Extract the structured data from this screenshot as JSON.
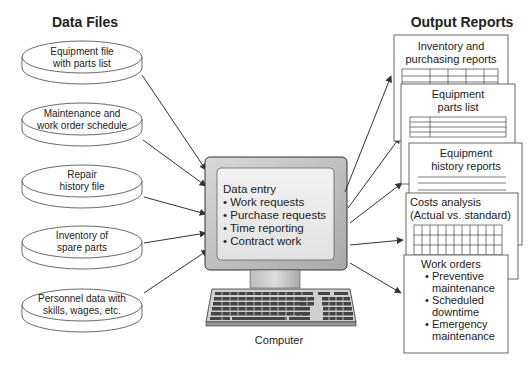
{
  "diagram": {
    "left_title": "Data Files",
    "right_title": "Output Reports",
    "data_files": [
      {
        "line1": "Equipment file",
        "line2": "with parts list"
      },
      {
        "line1": "Maintenance and",
        "line2": "work order schedule"
      },
      {
        "line1": "Repair",
        "line2": "history file"
      },
      {
        "line1": "Inventory of",
        "line2": "spare parts"
      },
      {
        "line1": "Personnel data with",
        "line2": "skills, wages, etc."
      }
    ],
    "computer": {
      "label": "Computer",
      "screen_heading": "Data entry",
      "screen_items": [
        "• Work requests",
        "• Purchase requests",
        "• Time reporting",
        "• Contract work"
      ]
    },
    "reports": [
      {
        "line1": "Inventory and",
        "line2": "purchasing reports"
      },
      {
        "line1": "Equipment",
        "line2": "parts list"
      },
      {
        "line1": "Equipment",
        "line2": "history reports"
      },
      {
        "line1": "Costs analysis",
        "line2": "(Actual vs. standard)"
      },
      {
        "heading": "Work orders",
        "items": [
          "• Preventive",
          "maintenance",
          "• Scheduled",
          "downtime",
          "• Emergency",
          "maintenance"
        ]
      }
    ]
  }
}
